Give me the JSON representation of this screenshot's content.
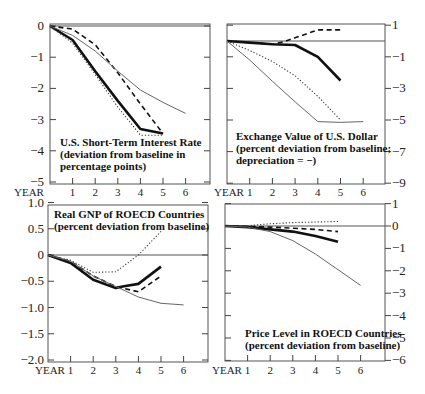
{
  "chart_data": [
    {
      "type": "line",
      "title": "U.S. Short-Term Interest Rate",
      "subtitle_lines": [
        "(deviation from baseline in",
        "percentage points)"
      ],
      "title_lines": [
        "U.S. Short-Term Interest Rate",
        "(deviation from baseline in",
        " percentage points)"
      ],
      "xlabel": "YEAR",
      "x_ticks": [
        "1",
        "2",
        "3",
        "4",
        "5",
        "6"
      ],
      "y_ticks": [
        "0",
        "−1",
        "−2",
        "−3",
        "−4",
        "−5"
      ],
      "y_tick_values": [
        0,
        -1,
        -2,
        -3,
        -4,
        -5
      ],
      "y_axis_side": "left",
      "ylim": [
        -5,
        0
      ],
      "grid": false,
      "series": [
        {
          "name": "thick-solid",
          "style": "thick",
          "x": [
            0,
            1,
            2,
            3,
            4,
            5
          ],
          "values": [
            0,
            -0.45,
            -1.45,
            -2.4,
            -3.3,
            -3.45
          ]
        },
        {
          "name": "dashed",
          "style": "dash",
          "x": [
            0,
            1,
            2,
            3,
            4,
            5
          ],
          "values": [
            0,
            -0.1,
            -0.6,
            -1.5,
            -2.5,
            -3.45
          ]
        },
        {
          "name": "dotted",
          "style": "dot",
          "x": [
            0,
            1,
            2,
            3,
            4,
            5
          ],
          "values": [
            0,
            -0.55,
            -1.55,
            -2.6,
            -3.5,
            -3.5
          ]
        },
        {
          "name": "thin-solid",
          "style": "thin",
          "x": [
            0,
            1,
            2,
            3,
            4,
            5,
            6
          ],
          "values": [
            0,
            -0.3,
            -0.8,
            -1.45,
            -2.05,
            -2.45,
            -2.8
          ]
        }
      ]
    },
    {
      "type": "line",
      "title": "Exchange Value of U.S. Dollar",
      "title_lines": [
        "Exchange Value of U.S. Dollar",
        "(percent deviation from baseline;",
        " depreciation  =  −)"
      ],
      "xlabel": "YEAR",
      "x_ticks": [
        "1",
        "2",
        "3",
        "4",
        "5",
        "6"
      ],
      "y_ticks": [
        "1",
        "−1",
        "−3",
        "−5",
        "−7",
        "−9"
      ],
      "y_tick_values": [
        1,
        -1,
        -3,
        -5,
        -7,
        -9
      ],
      "y_axis_side": "right",
      "ylim": [
        -9,
        1
      ],
      "grid": false,
      "series": [
        {
          "name": "thick-solid",
          "style": "thick",
          "x": [
            0,
            1,
            2,
            3,
            4,
            5
          ],
          "values": [
            0,
            -0.1,
            -0.2,
            -0.25,
            -1.0,
            -2.5
          ]
        },
        {
          "name": "dashed",
          "style": "dash",
          "x": [
            0,
            1,
            2,
            2.5,
            3,
            4,
            5
          ],
          "values": [
            0,
            -0.1,
            -0.2,
            -0.05,
            0.2,
            0.7,
            0.7
          ]
        },
        {
          "name": "dotted",
          "style": "dot",
          "x": [
            0,
            1,
            2,
            3,
            4,
            5
          ],
          "values": [
            0,
            -0.6,
            -1.3,
            -2.2,
            -3.5,
            -5.0
          ]
        },
        {
          "name": "thin-solid",
          "style": "thin",
          "x": [
            0,
            1,
            2,
            3,
            4,
            5,
            6
          ],
          "values": [
            0,
            -1.2,
            -2.55,
            -3.85,
            -5.1,
            -5.15,
            -5.1
          ]
        }
      ]
    },
    {
      "type": "line",
      "title": "Real GNP of ROECD Countries",
      "title_lines": [
        "Real GNP of ROECD Countries",
        "(percent deviation from baseline)"
      ],
      "xlabel": "YEAR",
      "x_ticks": [
        "1",
        "2",
        "3",
        "4",
        "5",
        "6"
      ],
      "y_ticks": [
        "1.0",
        "0.5",
        "0",
        "−0.5",
        "−1.0",
        "−1.5",
        "−2.0"
      ],
      "y_tick_values": [
        1.0,
        0.5,
        0,
        -0.5,
        -1.0,
        -1.5,
        -2.0
      ],
      "y_axis_side": "left",
      "ylim": [
        -2.0,
        1.0
      ],
      "grid": false,
      "series": [
        {
          "name": "thick-solid",
          "style": "thick",
          "x": [
            0,
            1,
            2,
            3,
            3.3,
            4,
            5
          ],
          "values": [
            0,
            -0.15,
            -0.47,
            -0.63,
            -0.6,
            -0.55,
            -0.22
          ]
        },
        {
          "name": "dashed",
          "style": "dash",
          "x": [
            0,
            1,
            2,
            3,
            4,
            5
          ],
          "values": [
            0,
            -0.12,
            -0.4,
            -0.6,
            -0.7,
            -0.4
          ]
        },
        {
          "name": "dotted",
          "style": "dot",
          "x": [
            0,
            1,
            2,
            3,
            4,
            5
          ],
          "values": [
            0,
            -0.1,
            -0.33,
            -0.32,
            0.0,
            0.45
          ]
        },
        {
          "name": "thin-solid",
          "style": "thin",
          "x": [
            0,
            1,
            2,
            3,
            4,
            5,
            6
          ],
          "values": [
            0,
            -0.12,
            -0.4,
            -0.6,
            -0.8,
            -0.92,
            -0.95
          ]
        }
      ]
    },
    {
      "type": "line",
      "title": "Price Level in ROECD Countries",
      "title_lines": [
        "Price Level in ROECD Countries",
        "(percent deviation from baseline)"
      ],
      "xlabel": "YEAR",
      "x_ticks": [
        "1",
        "2",
        "3",
        "4",
        "5",
        "6"
      ],
      "y_ticks": [
        "1",
        "0",
        "−1",
        "−2",
        "−3",
        "−4",
        "−5",
        "−6"
      ],
      "y_tick_values": [
        1,
        0,
        -1,
        -2,
        -3,
        -4,
        -5,
        -6
      ],
      "y_axis_side": "right",
      "ylim": [
        -6,
        1
      ],
      "grid": false,
      "series": [
        {
          "name": "thick-solid",
          "style": "thick",
          "x": [
            0,
            1,
            2,
            3,
            4,
            5
          ],
          "values": [
            0,
            -0.05,
            -0.15,
            -0.25,
            -0.45,
            -0.7
          ]
        },
        {
          "name": "dashed",
          "style": "dash",
          "x": [
            0,
            1,
            2,
            3,
            4,
            5
          ],
          "values": [
            0,
            -0.02,
            -0.05,
            -0.1,
            -0.15,
            -0.25
          ]
        },
        {
          "name": "dotted",
          "style": "dot",
          "x": [
            0,
            1,
            2,
            3,
            4,
            5
          ],
          "values": [
            0,
            0.02,
            0.1,
            0.15,
            0.18,
            0.2
          ]
        },
        {
          "name": "thin-solid",
          "style": "thin",
          "x": [
            0,
            1,
            2,
            3,
            4,
            5,
            6
          ],
          "values": [
            0,
            -0.05,
            -0.25,
            -0.65,
            -1.25,
            -1.95,
            -2.65
          ]
        }
      ]
    }
  ]
}
